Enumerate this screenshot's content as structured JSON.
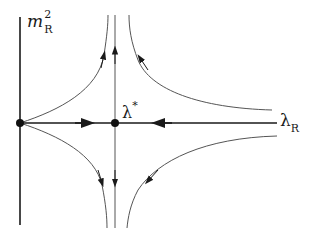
{
  "diagram": {
    "type": "RG flow phase diagram",
    "axes": {
      "y_label_base": "m",
      "y_label_sup": "2",
      "y_label_sub": "R",
      "x_label_base": "λ",
      "x_label_sub": "R"
    },
    "fixed_points": [
      {
        "name": "gaussian",
        "label": ""
      },
      {
        "name": "wilson-fisher",
        "label_base": "λ",
        "label_sup": "*"
      }
    ],
    "flows": [
      {
        "name": "axis-flow-right",
        "direction": "right"
      },
      {
        "name": "axis-flow-left",
        "direction": "left"
      },
      {
        "name": "critical-flow-up",
        "direction": "up"
      },
      {
        "name": "critical-flow-down",
        "direction": "down"
      },
      {
        "name": "upper-left-flow",
        "direction": "up"
      },
      {
        "name": "upper-right-flow",
        "direction": "up-left"
      },
      {
        "name": "lower-left-flow",
        "direction": "down"
      },
      {
        "name": "lower-right-flow",
        "direction": "down-left"
      }
    ],
    "colors": {
      "axis": "#1a1a1a",
      "flow": "#555555",
      "point": "#111111"
    }
  }
}
